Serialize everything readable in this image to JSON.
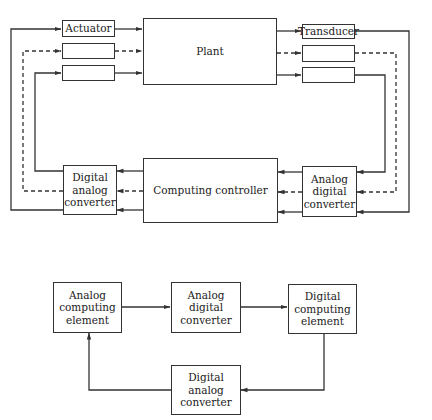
{
  "top_diagram": {
    "blocks": {
      "actuator": "Actuator",
      "actuator_2": "",
      "actuator_3": "",
      "plant": "Plant",
      "transducer": "Transducer",
      "transducer_2": "",
      "transducer_3": "",
      "dac": "Digital\nanalog\nconverter",
      "controller": "Computing controller",
      "adc": "Analog\ndigital\nconverter"
    },
    "line_styles": [
      "solid",
      "dashed",
      "solid"
    ],
    "stroke_color": "#333333"
  },
  "bottom_diagram": {
    "blocks": {
      "analog_computing": "Analog\ncomputing\nelement",
      "adc": "Analog\ndigital\nconverter",
      "digital_computing": "Digital\ncomputing\nelement",
      "dac": "Digital\nanalog\nconverter"
    },
    "flow": [
      "Analog computing element",
      "Analog digital converter",
      "Digital computing element",
      "Digital analog converter",
      "Analog computing element"
    ]
  }
}
